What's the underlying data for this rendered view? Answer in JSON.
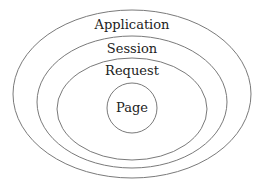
{
  "diagram": {
    "stroke_color": "#7a7a7a",
    "text_color": "#222222",
    "background": "#ffffff",
    "scopes": [
      {
        "id": "application",
        "label": "Application",
        "contains": "session"
      },
      {
        "id": "session",
        "label": "Session",
        "contains": "request"
      },
      {
        "id": "request",
        "label": "Request",
        "contains": "page"
      },
      {
        "id": "page",
        "label": "Page",
        "contains": null
      }
    ]
  }
}
